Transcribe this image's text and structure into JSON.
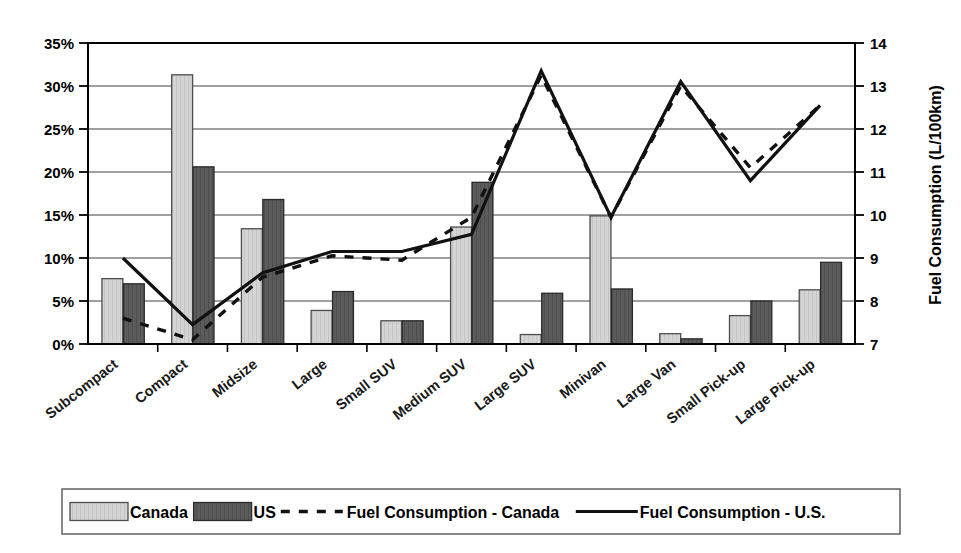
{
  "chart_data": {
    "type": "bar",
    "title": "",
    "xlabel": "",
    "ylabel": "",
    "y2label": "Fuel Consumption (L/100km)",
    "grid": true,
    "legend_position": "bottom",
    "categories": [
      "Subcompact",
      "Compact",
      "Midsize",
      "Large",
      "Small SUV",
      "Medium SUV",
      "Large SUV",
      "Minivan",
      "Large Van",
      "Small Pick-up",
      "Large Pick-up"
    ],
    "ylim": [
      0,
      35
    ],
    "yticks": [
      0,
      5,
      10,
      15,
      20,
      25,
      30,
      35
    ],
    "ytick_labels": [
      "0%",
      "5%",
      "10%",
      "15%",
      "20%",
      "25%",
      "30%",
      "35%"
    ],
    "y2lim": [
      7,
      14
    ],
    "y2ticks": [
      7,
      8,
      9,
      10,
      11,
      12,
      13,
      14
    ],
    "y2tick_labels": [
      "7",
      "8",
      "9",
      "10",
      "11",
      "12",
      "13",
      "14"
    ],
    "series": [
      {
        "name": "Canada",
        "kind": "bar",
        "axis": "left",
        "unit": "%",
        "color": "#d2d2d2",
        "edge_color": "#4d4d4d",
        "values": [
          7.6,
          31.3,
          13.4,
          3.9,
          2.7,
          13.6,
          1.1,
          14.9,
          1.2,
          3.3,
          6.3
        ]
      },
      {
        "name": "US",
        "kind": "bar",
        "axis": "left",
        "unit": "%",
        "color": "#595959",
        "edge_color": "#2b2b2b",
        "values": [
          7.0,
          20.6,
          16.8,
          6.1,
          2.7,
          18.8,
          5.9,
          6.4,
          0.6,
          5.0,
          9.5
        ]
      },
      {
        "name": "Fuel Consumption - Canada",
        "kind": "line",
        "style": "dashed",
        "axis": "right",
        "unit": "L/100km",
        "color": "#111111",
        "values": [
          7.6,
          7.1,
          8.55,
          9.05,
          8.95,
          9.95,
          13.25,
          9.95,
          13.0,
          11.1,
          12.55
        ]
      },
      {
        "name": "Fuel Consumption - U.S.",
        "kind": "line",
        "style": "solid",
        "axis": "right",
        "unit": "L/100km",
        "color": "#111111",
        "values": [
          9.0,
          7.45,
          8.65,
          9.15,
          9.15,
          9.55,
          13.35,
          9.95,
          13.1,
          10.8,
          12.55
        ]
      }
    ]
  },
  "legend": {
    "items": [
      {
        "label": "Canada",
        "marker": "swatch-light"
      },
      {
        "label": "US",
        "marker": "swatch-dark"
      },
      {
        "label": "Fuel Consumption - Canada",
        "marker": "dashed-line"
      },
      {
        "label": "Fuel Consumption - U.S.",
        "marker": "solid-line"
      }
    ]
  },
  "axes": {
    "right_title": "Fuel Consumption (L/100km)"
  }
}
